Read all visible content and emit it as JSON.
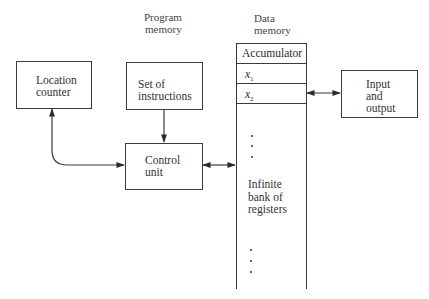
{
  "headers": {
    "program_memory": [
      "Program",
      "memory"
    ],
    "data_memory": [
      "Data",
      "memory"
    ]
  },
  "nodes": {
    "location_counter": [
      "Location",
      "counter"
    ],
    "set_of_instructions": [
      "Set of",
      "instructions"
    ],
    "control_unit": [
      "Control",
      "unit"
    ],
    "input_output": [
      "Input",
      "and",
      "output"
    ]
  },
  "data_memory": {
    "registers": {
      "accumulator": "Accumulator",
      "x1": {
        "base": "x",
        "sub": "1"
      },
      "x2": {
        "base": "x",
        "sub": "2"
      }
    },
    "infinite_bank": [
      "Infinite",
      "bank of",
      "registers"
    ]
  },
  "edges": [
    {
      "from": "set_of_instructions",
      "to": "control_unit",
      "direction": "one-way"
    },
    {
      "from": "location_counter",
      "to": "control_unit",
      "direction": "two-way",
      "shape": "curved"
    },
    {
      "from": "control_unit",
      "to": "data_memory",
      "direction": "two-way"
    },
    {
      "from": "data_memory.x2",
      "to": "input_output",
      "direction": "two-way"
    }
  ],
  "colors": {
    "line": "#3a3a3a",
    "text": "#333333",
    "background": "#ffffff"
  }
}
